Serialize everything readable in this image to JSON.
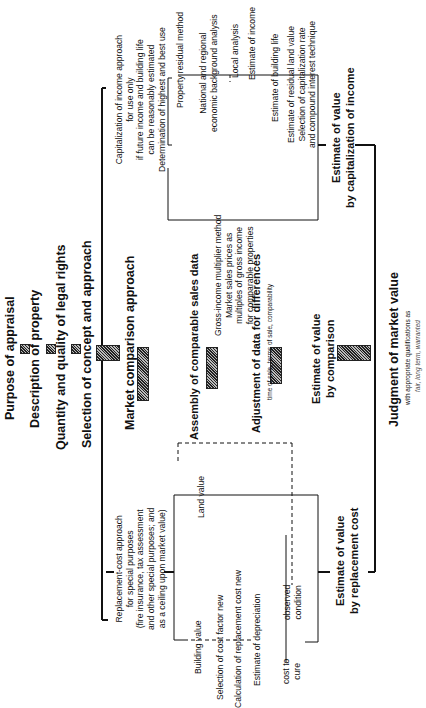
{
  "header": {
    "steps": [
      "Purpose of appraisal",
      "Description of property",
      "Quantity and quality of legal rights",
      "Selection of concept and approach"
    ]
  },
  "market": {
    "title": "Market comparison approach",
    "assembly": "Assembly of comparable sales data",
    "adjustment": "Adjustment of data for differences",
    "adjustment_note": "time of sale, terms of sale, comparability",
    "estimate": "Estimate of value\nby comparison"
  },
  "income": {
    "title": "Capitalization of income approach\nfor use only\nif future income and building life\ncan be reasonably estimated\nDetermination of highest and best use",
    "gim": "Gross-income multiplier method\nMarket sales prices as\nmultiples of gross income\nfor comparable properties",
    "property_residual": "Property residual method",
    "steps": [
      "National and regional\neconomic background analysis",
      "Local analysis",
      "Estimate of income",
      "Estimate of building life",
      "Estimate of residual land value\nSelection of capitalization rate\nand compound interest technique"
    ],
    "estimate": "Estimate of value\nby capitalization of income"
  },
  "replacement": {
    "title": "Replacement-cost approach\nfor special purposes\n(fire insurance, tax assessment\nand other special purposes; and\nas a ceiling upon market value)",
    "land_value": "Land value",
    "building_value": "Building value",
    "steps": [
      "Selection of cost factor new",
      "Calculation of replacement cost new",
      "Estimate of depreciation"
    ],
    "cost_to_cure": "cost to\ncure",
    "observed_condition": "observed\ncondition",
    "estimate": "Estimate of value\nby replacement cost"
  },
  "judgment": {
    "title": "Judgment of market value",
    "note": "with appropriate qualifications as",
    "note2": "fair, long term, warranted"
  }
}
